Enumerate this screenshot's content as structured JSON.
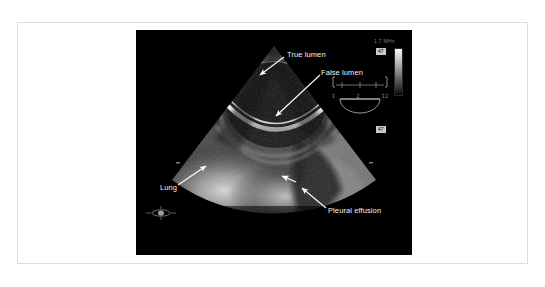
{
  "figure": {
    "modality": "transesophageal-echocardiography",
    "background_color": "#ffffff",
    "frame_border_color": "#dcdcdc",
    "panel_color": "#000000"
  },
  "annotations": [
    {
      "id": "true-lumen",
      "label": "True lumen"
    },
    {
      "id": "false-lumen",
      "label": "False lumen"
    },
    {
      "id": "lung",
      "label": "Lung"
    },
    {
      "id": "pleural-effusion",
      "label": "Pleural effusion"
    }
  ],
  "labels": {
    "true_lumen": "True lumen",
    "false_lumen": "False lumen",
    "lung": "Lung",
    "pleural_effusion": "Pleural effusion"
  },
  "machine_overlay": {
    "top_text": "1.7 MHz",
    "tag_upper": "47",
    "tag_lower": "47",
    "bottom_text": "",
    "grayscale_bar": {
      "orientation": "vertical",
      "top_color": "#f6f6f6",
      "bottom_color": "#050505"
    },
    "probe_scale_ticks": [
      "3",
      "2",
      "3.2"
    ]
  },
  "colors": {
    "label_text": "#f2f2f2",
    "arrow": "#ffffff",
    "overlay_text": "#7d7d7d",
    "tag_background": "#c9c9c9"
  }
}
